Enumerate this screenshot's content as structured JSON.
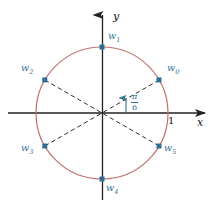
{
  "figure": {
    "title": "",
    "axes": {
      "x_label": "x",
      "y_label": "y",
      "unit_tick_label": "1"
    },
    "angle_annotation": {
      "numerator": "π",
      "denominator": "6",
      "text": "π/6"
    },
    "points": [
      {
        "label": "w",
        "sub": "0",
        "angle_deg": 30,
        "label_x": 167,
        "label_y": 68
      },
      {
        "label": "w",
        "sub": "1",
        "angle_deg": 90,
        "label_x": 108,
        "label_y": 35
      },
      {
        "label": "w",
        "sub": "2",
        "angle_deg": 150,
        "label_x": 22,
        "label_y": 68
      },
      {
        "label": "w",
        "sub": "3",
        "angle_deg": 210,
        "label_x": 22,
        "label_y": 146
      },
      {
        "label": "w",
        "sub": "4",
        "angle_deg": 270,
        "label_x": 106,
        "label_y": 186
      },
      {
        "label": "w",
        "sub": "5",
        "angle_deg": 330,
        "label_x": 164,
        "label_y": 146
      }
    ],
    "colors": {
      "circle": "#c0706b",
      "point": "#2f6f93",
      "label": "#2f6f93",
      "axis": "#222222",
      "dashed": "#1a1a1a",
      "background": "#ffffff"
    },
    "geometry": {
      "center_x": 102,
      "center_y": 113,
      "radius": 66
    }
  }
}
